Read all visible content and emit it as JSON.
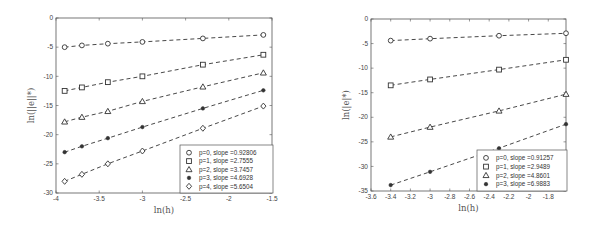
{
  "chart_data": [
    {
      "type": "line",
      "title": "",
      "xlabel": "ln(h)",
      "ylabel": "ln(||e||*)",
      "xlim": [
        -4,
        -1.5
      ],
      "ylim": [
        -30,
        0
      ],
      "xticks": [
        -4,
        -3.5,
        -3,
        -2.5,
        -2,
        -1.5
      ],
      "xtick_labels": [
        "-4",
        "-3.5",
        "-3",
        "-2.5",
        "-2",
        "-1.5"
      ],
      "yticks": [
        0,
        -5,
        -10,
        -15,
        -20,
        -25,
        -30
      ],
      "ytick_labels": [
        "0",
        "-5",
        "-10",
        "-15",
        "-20",
        "-25",
        "-30"
      ],
      "grid": false,
      "legend_position": "lower right",
      "line_style": "dashed",
      "x": [
        -3.9,
        -3.7,
        -3.4,
        -3.0,
        -2.3,
        -1.6
      ],
      "series": [
        {
          "name": "p=0, slope =0.92806",
          "marker": "circle",
          "values": [
            -5.0,
            -4.7,
            -4.4,
            -4.1,
            -3.5,
            -2.9
          ]
        },
        {
          "name": "p=1, slope =2.7555",
          "marker": "square",
          "values": [
            -12.5,
            -11.9,
            -11.0,
            -10.0,
            -8.0,
            -6.3
          ]
        },
        {
          "name": "p=2, slope =3.7457",
          "marker": "triangle",
          "values": [
            -17.8,
            -17.0,
            -16.0,
            -14.3,
            -11.8,
            -9.4
          ]
        },
        {
          "name": "p=3, slope =4.6928",
          "marker": "filled-dot",
          "values": [
            -23.0,
            -22.0,
            -20.6,
            -18.7,
            -15.5,
            -12.4
          ]
        },
        {
          "name": "p=4, slope =5.6504",
          "marker": "diamond",
          "values": [
            -28.0,
            -26.8,
            -25.0,
            -22.8,
            -18.9,
            -15.1
          ]
        }
      ]
    },
    {
      "type": "line",
      "title": "",
      "xlabel": "ln(h)",
      "ylabel": "ln(|e|*)",
      "xlim": [
        -3.6,
        -1.62
      ],
      "ylim": [
        -35,
        0
      ],
      "xticks": [
        -3.6,
        -3.4,
        -3.2,
        -3,
        -2.8,
        -2.6,
        -2.4,
        -2.2,
        -2,
        -1.8
      ],
      "xtick_labels": [
        "-3.6",
        "-3.4",
        "-3.2",
        "-3",
        "-2.8",
        "-2.6",
        "-2.4",
        "-2.2",
        "-2",
        "-1.8"
      ],
      "yticks": [
        0,
        -5,
        -10,
        -15,
        -20,
        -25,
        -30,
        -35
      ],
      "ytick_labels": [
        "0",
        "-5",
        "-10",
        "-15",
        "-20",
        "-25",
        "-30",
        "-35"
      ],
      "grid": false,
      "legend_position": "lower right",
      "line_style": "dashed",
      "x": [
        -3.4,
        -3.0,
        -2.3,
        -1.62
      ],
      "series": [
        {
          "name": "p=0, slope =0.91257",
          "marker": "circle",
          "values": [
            -4.4,
            -4.0,
            -3.4,
            -2.9
          ]
        },
        {
          "name": "p=1, slope =2.9489",
          "marker": "square",
          "values": [
            -13.5,
            -12.3,
            -10.3,
            -8.3
          ]
        },
        {
          "name": "p=2, slope =4.8601",
          "marker": "triangle",
          "values": [
            -24.0,
            -22.0,
            -18.7,
            -15.3
          ]
        },
        {
          "name": "p=3, slope =6.9883",
          "marker": "filled-dot",
          "values": [
            -33.8,
            -31.1,
            -26.3,
            -21.4
          ]
        }
      ]
    }
  ],
  "layout": [
    {
      "box": {
        "x0": 56,
        "y0": 18,
        "x1": 272,
        "y1": 193
      },
      "legend": {
        "x": 180,
        "y": 145,
        "w": 93,
        "h": 48
      }
    },
    {
      "box": {
        "x0": 371,
        "y0": 19,
        "x1": 566,
        "y1": 191
      },
      "legend": {
        "x": 477,
        "y": 150,
        "w": 90,
        "h": 41
      }
    }
  ],
  "colors": {
    "line": "#333333",
    "marker": "#333333",
    "axis": "#555555"
  }
}
